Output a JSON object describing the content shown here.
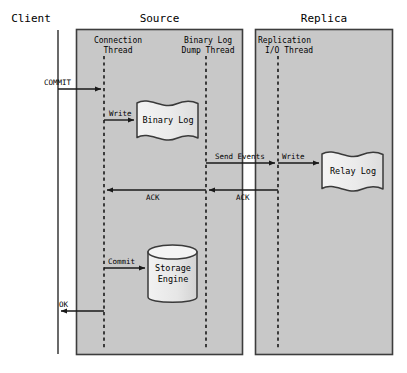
{
  "diagram": {
    "type": "sequence-diagram",
    "title_bar": {
      "client": "Client",
      "source": "Source",
      "replica": "Replica"
    },
    "lanes": [
      {
        "key": "client",
        "label": "Client"
      },
      {
        "key": "source",
        "label": "Source"
      },
      {
        "key": "replica",
        "label": "Replica"
      }
    ],
    "threads": [
      {
        "key": "connection",
        "line1": "Connection",
        "line2": "Thread"
      },
      {
        "key": "binlog_dump",
        "line1": "Binary Log",
        "line2": "Dump Thread"
      },
      {
        "key": "replication_io",
        "line1": "Replication",
        "line2": "I/O Thread"
      }
    ],
    "nodes": [
      {
        "key": "binary_log",
        "shape": "document",
        "line1": "Binary Log",
        "line2": ""
      },
      {
        "key": "relay_log",
        "shape": "document",
        "line1": "Relay Log",
        "line2": ""
      },
      {
        "key": "storage_engine",
        "shape": "cylinder",
        "line1": "Storage",
        "line2": "Engine"
      }
    ],
    "messages": [
      {
        "key": "commit",
        "label": "COMMIT",
        "from": "client",
        "to": "connection",
        "direction": "right"
      },
      {
        "key": "write_binlog",
        "label": "Write",
        "from": "connection",
        "to": "binary_log",
        "direction": "right"
      },
      {
        "key": "send_events",
        "label": "Send Events",
        "from": "binlog_dump",
        "to": "replication_io",
        "direction": "right"
      },
      {
        "key": "write_relay",
        "label": "Write",
        "from": "replication_io",
        "to": "relay_log",
        "direction": "right"
      },
      {
        "key": "ack_replica",
        "label": "ACK",
        "from": "replication_io",
        "to": "binlog_dump",
        "direction": "left"
      },
      {
        "key": "ack_source",
        "label": "ACK",
        "from": "binlog_dump",
        "to": "connection",
        "direction": "left"
      },
      {
        "key": "commit_engine",
        "label": "Commit",
        "from": "connection",
        "to": "storage_engine",
        "direction": "right"
      },
      {
        "key": "ok",
        "label": "OK",
        "from": "connection",
        "to": "client",
        "direction": "left"
      }
    ],
    "colors": {
      "lane_fill": "#c8c8c8",
      "lane_border": "#404040",
      "node_fill": "#f0f0f0",
      "node_border": "#3a3a3a",
      "line": "#1a1a1a",
      "background": "#ffffff"
    }
  }
}
